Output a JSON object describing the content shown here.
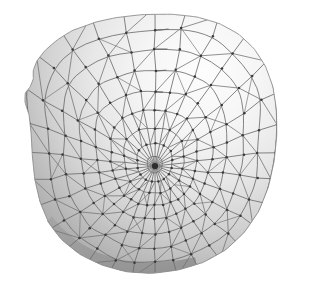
{
  "document": {
    "title": "Quad-dominant surface mesh with radial pole singularity",
    "background_color": "#ffffff",
    "width": 309,
    "height": 284
  },
  "render": {
    "type": "shaded-wireframe-3d-surface",
    "shape_name": "curved-shell-dome",
    "surface_fill_light": "#fbfbfb",
    "surface_fill_mid": "#cfcfcf",
    "surface_fill_dark": "#8f8f8f",
    "backface_fill": "#a8a8a8",
    "edge_color": "#6e6e6e",
    "edge_color_soft": "#8a8a8a",
    "vertex_color": "#3a3a3a",
    "edge_width": 0.85,
    "vertex_radius": 1.25,
    "light_direction": "upper-right",
    "shading_model": "smooth-gouraud-grayscale"
  },
  "topology": {
    "pole": {
      "label": "center-singularity",
      "x": 155,
      "y": 166,
      "valence": 30
    },
    "spoke_count": 30,
    "ring_count": 9,
    "boundary_ring_count": 1,
    "element_type": "triangles-and-quads",
    "has_boundary": true,
    "silhouette_fold": true
  },
  "geometry": {
    "outline": [
      [
        96,
        22
      ],
      [
        118,
        17
      ],
      [
        146,
        14
      ],
      [
        175,
        14
      ],
      [
        200,
        17
      ],
      [
        222,
        24
      ],
      [
        241,
        35
      ],
      [
        256,
        50
      ],
      [
        267,
        68
      ],
      [
        274,
        89
      ],
      [
        277,
        112
      ],
      [
        277,
        138
      ],
      [
        274,
        164
      ],
      [
        268,
        190
      ],
      [
        258,
        214
      ],
      [
        243,
        235
      ],
      [
        224,
        252
      ],
      [
        201,
        264
      ],
      [
        176,
        271
      ],
      [
        150,
        274
      ],
      [
        124,
        272
      ],
      [
        100,
        265
      ],
      [
        78,
        254
      ],
      [
        60,
        239
      ],
      [
        47,
        221
      ],
      [
        39,
        200
      ],
      [
        34,
        177
      ],
      [
        32,
        153
      ],
      [
        31,
        130
      ],
      [
        29,
        112
      ],
      [
        24,
        100
      ],
      [
        25,
        92
      ],
      [
        31,
        86
      ],
      [
        34,
        78
      ],
      [
        33,
        69
      ],
      [
        37,
        60
      ],
      [
        46,
        49
      ],
      [
        58,
        39
      ],
      [
        74,
        29
      ]
    ],
    "fold_band": [
      [
        277,
        112
      ],
      [
        277,
        138
      ],
      [
        274,
        164
      ],
      [
        268,
        190
      ],
      [
        258,
        214
      ],
      [
        243,
        235
      ],
      [
        224,
        252
      ],
      [
        201,
        264
      ],
      [
        206,
        256
      ],
      [
        227,
        241
      ],
      [
        244,
        222
      ],
      [
        256,
        199
      ],
      [
        264,
        174
      ],
      [
        268,
        148
      ],
      [
        269,
        124
      ],
      [
        268,
        112
      ]
    ],
    "bottom_rim": [
      [
        47,
        221
      ],
      [
        60,
        239
      ],
      [
        78,
        254
      ],
      [
        100,
        265
      ],
      [
        124,
        272
      ],
      [
        150,
        274
      ],
      [
        176,
        271
      ],
      [
        201,
        264
      ],
      [
        196,
        255
      ],
      [
        170,
        262
      ],
      [
        144,
        263
      ],
      [
        118,
        260
      ],
      [
        95,
        252
      ],
      [
        75,
        240
      ],
      [
        59,
        226
      ],
      [
        50,
        214
      ]
    ],
    "ring_radii_norm": [
      0.06,
      0.14,
      0.24,
      0.35,
      0.47,
      0.6,
      0.73,
      0.87,
      1.0
    ],
    "radius_profile": {
      "rx_outer": 124,
      "ry_outer": 132,
      "squash_x": 0.93,
      "squash_y": 1.0
    }
  },
  "chart_data": {
    "type": "scatter",
    "title": "Quad-dominant surface mesh with radial pole singularity",
    "xlabel": "",
    "ylabel": "",
    "grid": false,
    "legend": "none",
    "series": [
      {
        "name": "pole-spokes",
        "values": [
          30
        ]
      },
      {
        "name": "concentric-rings",
        "values": [
          9
        ]
      },
      {
        "name": "ring-radii-normalized",
        "values": [
          0.06,
          0.14,
          0.24,
          0.35,
          0.47,
          0.6,
          0.73,
          0.87,
          1.0
        ]
      }
    ]
  }
}
